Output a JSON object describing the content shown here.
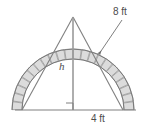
{
  "figure": {
    "type": "geometry-diagram",
    "labels": {
      "radius_label": "8 ft",
      "height_label": "h",
      "base_label": "4 ft"
    },
    "colors": {
      "block_fill": "#dcdcdc",
      "block_stroke": "#8c8c8c",
      "arc_stroke": "#707070",
      "line_stroke": "#808080",
      "baseline_stroke": "#808080",
      "text": "#4d4d4d",
      "background": "#ffffff"
    },
    "geometry": {
      "apex": {
        "x": 73,
        "y": 17
      },
      "left_spring": {
        "x": 22,
        "y": 110
      },
      "right_spring": {
        "x": 123,
        "y": 110
      },
      "center": {
        "x": 73,
        "y": 110
      },
      "inner_radius": 51,
      "outer_radius": 61,
      "voussoir_count": 22,
      "baseline_y": 110,
      "baseline_x_start": 15,
      "baseline_x_end": 136
    },
    "callout": {
      "radius_leader_start": {
        "x": 122,
        "y": 20
      },
      "radius_leader_end": {
        "x": 99,
        "y": 54
      },
      "arrow_present": true
    },
    "right_angle_marker": {
      "present": true,
      "x": 66,
      "y": 103,
      "size": 7
    }
  }
}
